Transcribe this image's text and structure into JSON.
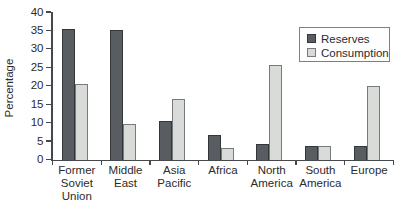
{
  "chart_data": {
    "type": "bar",
    "ylabel": "Percentage",
    "xlabel": "",
    "ylim": [
      0,
      40
    ],
    "yticks": [
      0,
      5,
      10,
      15,
      20,
      25,
      30,
      35,
      40
    ],
    "grid": false,
    "legend_position": "top-right",
    "categories": [
      "Former Soviet Union",
      "Middle East",
      "Asia Pacific",
      "Africa",
      "North America",
      "South America",
      "Europe"
    ],
    "series": [
      {
        "name": "Reserves",
        "color": "#595d62",
        "border_color": "#34373a",
        "values": [
          35.5,
          35.0,
          10.5,
          6.7,
          4.2,
          3.8,
          3.8
        ]
      },
      {
        "name": "Consumption",
        "color": "#d9dbd8",
        "border_color": "#777a7c",
        "values": [
          20.5,
          9.5,
          16.5,
          3.0,
          25.5,
          3.8,
          20.0
        ]
      }
    ]
  }
}
